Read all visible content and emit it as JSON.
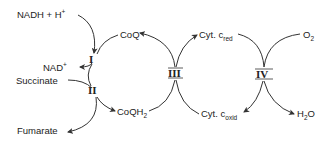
{
  "diagram": {
    "complexes": [
      {
        "id": "I",
        "label": "I"
      },
      {
        "id": "II",
        "label": "II"
      },
      {
        "id": "III",
        "label": "III"
      },
      {
        "id": "IV",
        "label": "IV"
      }
    ],
    "species": {
      "nadh": {
        "main": "NADH + H",
        "sup": "+"
      },
      "nad": {
        "main": "NAD",
        "sup": "+"
      },
      "succinate": {
        "main": "Succinate"
      },
      "fumarate": {
        "main": "Fumarate"
      },
      "coq": {
        "main": "CoQ"
      },
      "coqh2": {
        "main": "CoQH",
        "sub": "2"
      },
      "cytc_red": {
        "main": "Cyt. c",
        "sub": "red"
      },
      "cytc_oxid": {
        "main": "Cyt. c",
        "sub": "oxid"
      },
      "o2": {
        "main": "O",
        "sub": "2"
      },
      "h2o": {
        "main": "H",
        "sub": "2",
        "tail": "O"
      }
    },
    "arrows": [
      {
        "from": "NADH + H+",
        "via": "I",
        "to": "NAD+"
      },
      {
        "from": "CoQ",
        "via": "I",
        "to": "CoQH2"
      },
      {
        "from": "Succinate",
        "via": "II",
        "to": "Fumarate"
      },
      {
        "from": "CoQ",
        "via": "II",
        "to": "CoQH2"
      },
      {
        "from": "CoQH2",
        "via": "III",
        "to": "CoQ"
      },
      {
        "from": "Cyt. c oxid",
        "via": "III",
        "to": "Cyt. c red"
      },
      {
        "from": "Cyt. c red",
        "via": "IV",
        "to": "Cyt. c oxid"
      },
      {
        "from": "O2",
        "via": "IV",
        "to": "H2O"
      }
    ]
  }
}
